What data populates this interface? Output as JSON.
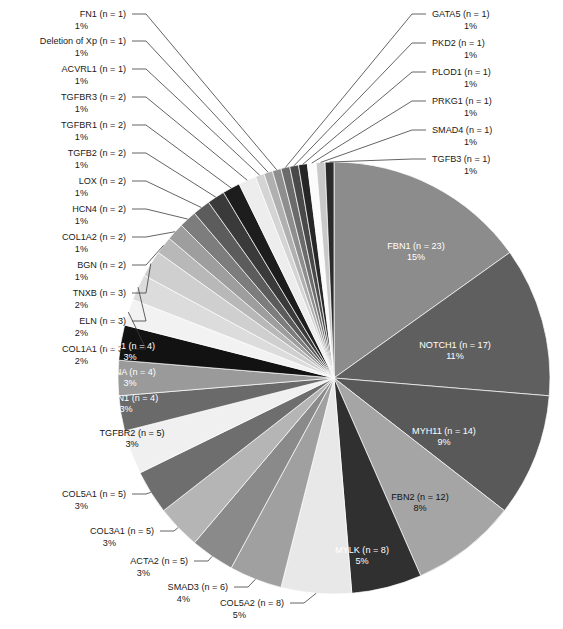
{
  "chart_data": {
    "type": "pie",
    "title": "",
    "subtitle": "",
    "xlabel": "",
    "ylabel": "",
    "legend_position": "none",
    "grid": false,
    "total_n": 154,
    "start_angle_deg": 0,
    "direction": "clockwise",
    "labels": [
      "FBN1 (n = 23)",
      "NOTCH1 (n = 17)",
      "MYH11 (n = 14)",
      "FBN2 (n = 12)",
      "MYLK (n = 8)",
      "COL5A2 (n = 8)",
      "SMAD3 (n = 6)",
      "ACTA2 (n = 5)",
      "COL3A1 (n = 5)",
      "COL5A1 (n = 5)",
      "TGFBR2 (n = 5)",
      "EMILIN1 (n = 4)",
      "FLNA (n = 4)",
      "MIB1 (n = 4)",
      "COL1A1 (n = 3)",
      "ELN (n = 3)",
      "TNXB (n = 3)",
      "BGN (n = 2)",
      "COL1A2 (n = 2)",
      "HCN4 (n = 2)",
      "LOX (n = 2)",
      "TGFB2 (n = 2)",
      "TGFBR1 (n = 2)",
      "TGFBR3 (n = 2)",
      "ACVRL1 (n = 1)",
      "Deletion of Xp (n = 1)",
      "FN1 (n = 1)",
      "GATA5 (n = 1)",
      "PKD2 (n = 1)",
      "PLOD1 (n = 1)",
      "PRKG1 (n = 1)",
      "SMAD4 (n = 1)",
      "TGFB3 (n = 1)"
    ],
    "categories": [
      "FBN1",
      "NOTCH1",
      "MYH11",
      "FBN2",
      "MYLK",
      "COL5A2",
      "SMAD3",
      "ACTA2",
      "COL3A1",
      "COL5A1",
      "TGFBR2",
      "EMILIN1",
      "FLNA",
      "MIB1",
      "COL1A1",
      "ELN",
      "TNXB",
      "BGN",
      "COL1A2",
      "HCN4",
      "LOX",
      "TGFB2",
      "TGFBR1",
      "TGFBR3",
      "ACVRL1",
      "Deletion of Xp",
      "FN1",
      "GATA5",
      "PKD2",
      "PLOD1",
      "PRKG1",
      "SMAD4",
      "TGFB3"
    ],
    "values": [
      23,
      17,
      14,
      12,
      8,
      8,
      6,
      5,
      5,
      5,
      5,
      4,
      4,
      4,
      3,
      3,
      3,
      2,
      2,
      2,
      2,
      2,
      2,
      2,
      1,
      1,
      1,
      1,
      1,
      1,
      1,
      1,
      1
    ],
    "percent_labels": [
      "15%",
      "11%",
      "9%",
      "8%",
      "5%",
      "5%",
      "4%",
      "3%",
      "3%",
      "3%",
      "3%",
      "3%",
      "3%",
      "3%",
      "2%",
      "2%",
      "2%",
      "1%",
      "1%",
      "1%",
      "1%",
      "1%",
      "1%",
      "1%",
      "1%",
      "1%",
      "1%",
      "1%",
      "1%",
      "1%",
      "1%",
      "1%",
      "1%"
    ],
    "colors": [
      "#8c8c8c",
      "#5f5f5f",
      "#595959",
      "#a5a5a5",
      "#303030",
      "#e8e8e8",
      "#a0a0a0",
      "#8a8a8a",
      "#b5b5b5",
      "#6e6e6e",
      "#f0f0f0",
      "#6a6a6a",
      "#9a9a9a",
      "#121212",
      "#f2f2f2",
      "#dcdcdc",
      "#cfcfcf",
      "#b8b8b8",
      "#9e9e9e",
      "#7d7d7d",
      "#5c5c5c",
      "#3a3a3a",
      "#1d1d1d",
      "#ededed",
      "#d4d4d4",
      "#b0b0b0",
      "#8e8e8e",
      "#6b6b6b",
      "#494949",
      "#262626",
      "#ffffff",
      "#c9c9c9",
      "#2b2b2b"
    ],
    "slices": [
      {
        "name": "FBN1",
        "n": 23,
        "label": "FBN1 (n = 23)",
        "percent": "15%",
        "color": "#8c8c8c",
        "label_place": "inside",
        "label_fill": "light"
      },
      {
        "name": "NOTCH1",
        "n": 17,
        "label": "NOTCH1 (n = 17)",
        "percent": "11%",
        "color": "#5f5f5f",
        "label_place": "inside",
        "label_fill": "light"
      },
      {
        "name": "MYH11",
        "n": 14,
        "label": "MYH11 (n = 14)",
        "percent": "9%",
        "color": "#595959",
        "label_place": "inside",
        "label_fill": "light"
      },
      {
        "name": "FBN2",
        "n": 12,
        "label": "FBN2 (n = 12)",
        "percent": "8%",
        "color": "#a5a5a5",
        "label_place": "inside",
        "label_fill": "dark"
      },
      {
        "name": "MYLK",
        "n": 8,
        "label": "MYLK (n = 8)",
        "percent": "5%",
        "color": "#303030",
        "label_place": "inside",
        "label_fill": "light"
      },
      {
        "name": "COL5A2",
        "n": 8,
        "label": "COL5A2 (n = 8)",
        "percent": "5%",
        "color": "#e8e8e8",
        "label_place": "outside",
        "label_fill": "dark"
      },
      {
        "name": "SMAD3",
        "n": 6,
        "label": "SMAD3 (n = 6)",
        "percent": "4%",
        "color": "#a0a0a0",
        "label_place": "outside",
        "label_fill": "dark"
      },
      {
        "name": "ACTA2",
        "n": 5,
        "label": "ACTA2 (n = 5)",
        "percent": "3%",
        "color": "#8a8a8a",
        "label_place": "outside",
        "label_fill": "dark"
      },
      {
        "name": "COL3A1",
        "n": 5,
        "label": "COL3A1 (n = 5)",
        "percent": "3%",
        "color": "#b5b5b5",
        "label_place": "outside",
        "label_fill": "dark"
      },
      {
        "name": "COL5A1",
        "n": 5,
        "label": "COL5A1 (n = 5)",
        "percent": "3%",
        "color": "#6e6e6e",
        "label_place": "outside",
        "label_fill": "dark"
      },
      {
        "name": "TGFBR2",
        "n": 5,
        "label": "TGFBR2 (n = 5)",
        "percent": "3%",
        "color": "#f0f0f0",
        "label_place": "inside",
        "label_fill": "dark"
      },
      {
        "name": "EMILIN1",
        "n": 4,
        "label": "EMILIN1 (n = 4)",
        "percent": "3%",
        "color": "#6a6a6a",
        "label_place": "inside",
        "label_fill": "light"
      },
      {
        "name": "FLNA",
        "n": 4,
        "label": "FLNA (n = 4)",
        "percent": "3%",
        "color": "#9a9a9a",
        "label_place": "inside",
        "label_fill": "light"
      },
      {
        "name": "MIB1",
        "n": 4,
        "label": "MIB1 (n = 4)",
        "percent": "3%",
        "color": "#121212",
        "label_place": "inside",
        "label_fill": "light"
      },
      {
        "name": "COL1A1",
        "n": 3,
        "label": "COL1A1 (n = 3)",
        "percent": "2%",
        "color": "#f2f2f2",
        "label_place": "outside",
        "label_fill": "dark"
      },
      {
        "name": "ELN",
        "n": 3,
        "label": "ELN (n = 3)",
        "percent": "2%",
        "color": "#dcdcdc",
        "label_place": "outside",
        "label_fill": "dark"
      },
      {
        "name": "TNXB",
        "n": 3,
        "label": "TNXB (n = 3)",
        "percent": "2%",
        "color": "#cfcfcf",
        "label_place": "outside",
        "label_fill": "dark"
      },
      {
        "name": "BGN",
        "n": 2,
        "label": "BGN (n = 2)",
        "percent": "1%",
        "color": "#b8b8b8",
        "label_place": "outside",
        "label_fill": "dark"
      },
      {
        "name": "COL1A2",
        "n": 2,
        "label": "COL1A2 (n = 2)",
        "percent": "1%",
        "color": "#9e9e9e",
        "label_place": "outside",
        "label_fill": "dark"
      },
      {
        "name": "HCN4",
        "n": 2,
        "label": "HCN4 (n = 2)",
        "percent": "1%",
        "color": "#7d7d7d",
        "label_place": "outside",
        "label_fill": "dark"
      },
      {
        "name": "LOX",
        "n": 2,
        "label": "LOX (n = 2)",
        "percent": "1%",
        "color": "#5c5c5c",
        "label_place": "outside",
        "label_fill": "dark"
      },
      {
        "name": "TGFB2",
        "n": 2,
        "label": "TGFB2 (n = 2)",
        "percent": "1%",
        "color": "#3a3a3a",
        "label_place": "outside",
        "label_fill": "dark"
      },
      {
        "name": "TGFBR1",
        "n": 2,
        "label": "TGFBR1 (n = 2)",
        "percent": "1%",
        "color": "#1d1d1d",
        "label_place": "outside",
        "label_fill": "dark"
      },
      {
        "name": "TGFBR3",
        "n": 2,
        "label": "TGFBR3 (n = 2)",
        "percent": "1%",
        "color": "#ededed",
        "label_place": "outside",
        "label_fill": "dark"
      },
      {
        "name": "ACVRL1",
        "n": 1,
        "label": "ACVRL1 (n = 1)",
        "percent": "1%",
        "color": "#d4d4d4",
        "label_place": "outside",
        "label_fill": "dark"
      },
      {
        "name": "Deletion of Xp",
        "n": 1,
        "label": "Deletion of Xp (n = 1)",
        "percent": "1%",
        "color": "#b0b0b0",
        "label_place": "outside",
        "label_fill": "dark"
      },
      {
        "name": "FN1",
        "n": 1,
        "label": "FN1 (n = 1)",
        "percent": "1%",
        "color": "#8e8e8e",
        "label_place": "outside",
        "label_fill": "dark"
      },
      {
        "name": "GATA5",
        "n": 1,
        "label": "GATA5 (n = 1)",
        "percent": "1%",
        "color": "#6b6b6b",
        "label_place": "outside",
        "label_fill": "dark"
      },
      {
        "name": "PKD2",
        "n": 1,
        "label": "PKD2 (n = 1)",
        "percent": "1%",
        "color": "#494949",
        "label_place": "outside",
        "label_fill": "dark"
      },
      {
        "name": "PLOD1",
        "n": 1,
        "label": "PLOD1 (n = 1)",
        "percent": "1%",
        "color": "#262626",
        "label_place": "outside",
        "label_fill": "dark"
      },
      {
        "name": "PRKG1",
        "n": 1,
        "label": "PRKG1 (n = 1)",
        "percent": "1%",
        "color": "#fbfbfb",
        "label_place": "outside",
        "label_fill": "dark"
      },
      {
        "name": "SMAD4",
        "n": 1,
        "label": "SMAD4 (n = 1)",
        "percent": "1%",
        "color": "#c9c9c9",
        "label_place": "outside",
        "label_fill": "dark"
      },
      {
        "name": "TGFB3",
        "n": 1,
        "label": "TGFB3 (n = 1)",
        "percent": "1%",
        "color": "#2b2b2b",
        "label_place": "outside",
        "label_fill": "dark"
      }
    ]
  },
  "geometry": {
    "cx": 334,
    "cy": 378,
    "r": 216
  },
  "outside_labels": {
    "right": [
      {
        "name": "GATA5",
        "label": "GATA5 (n = 1)",
        "percent": "1%",
        "tx": 432,
        "ty": 17,
        "elbow_x": 412,
        "anchor_x": 303,
        "anchor_y": 163
      },
      {
        "name": "PKD2",
        "label": "PKD2 (n = 1)",
        "percent": "1%",
        "tx": 432,
        "ty": 46,
        "elbow_x": 412,
        "anchor_x": 307,
        "anchor_y": 163
      },
      {
        "name": "PLOD1",
        "label": "PLOD1 (n = 1)",
        "percent": "1%",
        "tx": 432,
        "ty": 75,
        "elbow_x": 412,
        "anchor_x": 311,
        "anchor_y": 163
      },
      {
        "name": "PRKG1",
        "label": "PRKG1 (n = 1)",
        "percent": "1%",
        "tx": 432,
        "ty": 104,
        "elbow_x": 412,
        "anchor_x": 315,
        "anchor_y": 163
      },
      {
        "name": "SMAD4",
        "label": "SMAD4 (n = 1)",
        "percent": "1%",
        "tx": 432,
        "ty": 133,
        "elbow_x": 412,
        "anchor_x": 320,
        "anchor_y": 163
      },
      {
        "name": "TGFB3",
        "label": "TGFB3 (n = 1)",
        "percent": "1%",
        "tx": 432,
        "ty": 162,
        "elbow_x": 412,
        "anchor_x": 326,
        "anchor_y": 163
      }
    ],
    "left": [
      {
        "name": "FN1",
        "label": "FN1 (n = 1)",
        "percent": "1%",
        "tx": 126,
        "ty": 17,
        "elbow_x": 146,
        "anchor_x": 270,
        "anchor_y": 163
      },
      {
        "name": "Deletion of Xp",
        "label": "Deletion of Xp (n = 1)",
        "percent": "1%",
        "tx": 126,
        "ty": 44,
        "elbow_x": 146,
        "anchor_x": 268,
        "anchor_y": 167
      },
      {
        "name": "ACVRL1",
        "label": "ACVRL1 (n = 1)",
        "percent": "1%",
        "tx": 126,
        "ty": 72,
        "elbow_x": 146,
        "anchor_x": 264,
        "anchor_y": 171
      },
      {
        "name": "TGFBR3",
        "label": "TGFBR3 (n = 2)",
        "percent": "1%",
        "tx": 126,
        "ty": 100,
        "elbow_x": 146,
        "anchor_x": 259,
        "anchor_y": 175
      },
      {
        "name": "TGFBR1",
        "label": "TGFBR1 (n = 2)",
        "percent": "1%",
        "tx": 126,
        "ty": 128,
        "elbow_x": 146,
        "anchor_x": 251,
        "anchor_y": 180
      },
      {
        "name": "TGFB2",
        "label": "TGFB2 (n = 2)",
        "percent": "1%",
        "tx": 126,
        "ty": 156,
        "elbow_x": 146,
        "anchor_x": 243,
        "anchor_y": 187
      },
      {
        "name": "LOX",
        "label": "LOX (n = 2)",
        "percent": "1%",
        "tx": 126,
        "ty": 184,
        "elbow_x": 146,
        "anchor_x": 234,
        "anchor_y": 195
      },
      {
        "name": "HCN4",
        "label": "HCN4 (n = 2)",
        "percent": "1%",
        "tx": 126,
        "ty": 212,
        "elbow_x": 146,
        "anchor_x": 224,
        "anchor_y": 204
      },
      {
        "name": "COL1A2",
        "label": "COL1A2 (n = 2)",
        "percent": "1%",
        "tx": 126,
        "ty": 240,
        "elbow_x": 146,
        "anchor_x": 214,
        "anchor_y": 215
      },
      {
        "name": "BGN",
        "label": "BGN (n = 2)",
        "percent": "1%",
        "tx": 126,
        "ty": 268,
        "elbow_x": 146,
        "anchor_x": 205,
        "anchor_y": 227
      },
      {
        "name": "TNXB",
        "label": "TNXB (n = 3)",
        "percent": "2%",
        "tx": 126,
        "ty": 296,
        "elbow_x": 146,
        "anchor_x": 194,
        "anchor_y": 242
      },
      {
        "name": "ELN",
        "label": "ELN (n = 3)",
        "percent": "2%",
        "tx": 126,
        "ty": 324,
        "elbow_x": 146,
        "anchor_x": 182,
        "anchor_y": 261
      },
      {
        "name": "COL1A1",
        "label": "COL1A1 (n = 3)",
        "percent": "2%",
        "tx": 126,
        "ty": 352,
        "elbow_x": 146,
        "anchor_x": 170,
        "anchor_y": 282
      }
    ],
    "bottom_left": [
      {
        "name": "COL5A1",
        "label": "COL5A1 (n = 5)",
        "percent": "3%",
        "tx": 126,
        "ty": 497,
        "elbow_x": 146,
        "anchor_x": 166,
        "anchor_y": 486
      },
      {
        "name": "COL3A1",
        "label": "COL3A1 (n = 5)",
        "percent": "3%",
        "tx": 154,
        "ty": 534,
        "elbow_x": 174,
        "anchor_x": 194,
        "anchor_y": 518
      },
      {
        "name": "ACTA2",
        "label": "ACTA2 (n = 5)",
        "percent": "3%",
        "tx": 188,
        "ty": 564,
        "elbow_x": 208,
        "anchor_x": 224,
        "anchor_y": 549
      },
      {
        "name": "SMAD3",
        "label": "SMAD3 (n = 6)",
        "percent": "4%",
        "tx": 228,
        "ty": 590,
        "elbow_x": 248,
        "anchor_x": 262,
        "anchor_y": 572
      },
      {
        "name": "COL5A2",
        "label": "COL5A2 (n = 8)",
        "percent": "5%",
        "tx": 284,
        "ty": 606,
        "elbow_x": 304,
        "anchor_x": 310,
        "anchor_y": 588
      }
    ]
  },
  "inside_labels": [
    {
      "name": "FBN1",
      "label": "FBN1 (n = 23)",
      "percent": "15%",
      "x": 416,
      "y": 249,
      "fill": "light"
    },
    {
      "name": "NOTCH1",
      "label": "NOTCH1 (n = 17)",
      "percent": "11%",
      "x": 455,
      "y": 348,
      "fill": "light"
    },
    {
      "name": "MYH11",
      "label": "MYH11 (n = 14)",
      "percent": "9%",
      "x": 444,
      "y": 434,
      "fill": "light"
    },
    {
      "name": "FBN2",
      "label": "FBN2 (n = 12)",
      "percent": "8%",
      "x": 420,
      "y": 500,
      "fill": "dark"
    },
    {
      "name": "MYLK",
      "label": "MYLK (n = 8)",
      "percent": "5%",
      "x": 362,
      "y": 553,
      "fill": "light"
    },
    {
      "name": "MIB1",
      "label": "MIB1 (n = 4)",
      "percent": "3%",
      "x": 130,
      "y": 349,
      "fill": "light"
    },
    {
      "name": "FLNA",
      "label": "FLNA (n = 4)",
      "percent": "3%",
      "x": 130,
      "y": 375,
      "fill": "light"
    },
    {
      "name": "EMILIN1",
      "label": "EMILIN1 (n = 4)",
      "percent": "3%",
      "x": 126,
      "y": 401,
      "fill": "light"
    },
    {
      "name": "TGFBR2",
      "label": "TGFBR2 (n = 5)",
      "percent": "3%",
      "x": 132,
      "y": 436,
      "fill": "dark"
    }
  ]
}
